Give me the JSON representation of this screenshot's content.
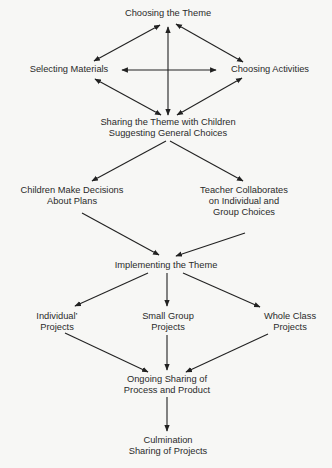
{
  "diagram": {
    "type": "flowchart",
    "nodes": {
      "choosing_theme": [
        "Choosing the Theme"
      ],
      "selecting_materials": [
        "Selecting Materials"
      ],
      "choosing_activities": [
        "Choosing Activities"
      ],
      "sharing_theme": [
        "Sharing the Theme with Children",
        "Suggesting General Choices"
      ],
      "children_decide": [
        "Children Make Decisions",
        "About Plans"
      ],
      "teacher_collaborates": [
        "Teacher Collaborates",
        "on Individual and",
        "Group Choices"
      ],
      "implementing": [
        "Implementing the Theme"
      ],
      "individual": [
        "Individual’",
        "Projects"
      ],
      "small_group": [
        "Small Group",
        "Projects"
      ],
      "whole_class": [
        "Whole Class",
        "Projects"
      ],
      "ongoing": [
        "Ongoing Sharing of",
        "Process and Product"
      ],
      "culmination": [
        "Culmination",
        "Sharing of Projects"
      ]
    },
    "edges": [
      {
        "from": "choosing_theme",
        "to": "selecting_materials",
        "bidirectional": true
      },
      {
        "from": "choosing_theme",
        "to": "choosing_activities",
        "bidirectional": true
      },
      {
        "from": "choosing_theme",
        "to": "sharing_theme",
        "bidirectional": true
      },
      {
        "from": "selecting_materials",
        "to": "choosing_activities",
        "bidirectional": true
      },
      {
        "from": "selecting_materials",
        "to": "sharing_theme",
        "bidirectional": true
      },
      {
        "from": "choosing_activities",
        "to": "sharing_theme",
        "bidirectional": true
      },
      {
        "from": "sharing_theme",
        "to": "children_decide"
      },
      {
        "from": "sharing_theme",
        "to": "teacher_collaborates"
      },
      {
        "from": "children_decide",
        "to": "implementing"
      },
      {
        "from": "teacher_collaborates",
        "to": "implementing"
      },
      {
        "from": "implementing",
        "to": "individual"
      },
      {
        "from": "implementing",
        "to": "small_group"
      },
      {
        "from": "implementing",
        "to": "whole_class"
      },
      {
        "from": "individual",
        "to": "ongoing"
      },
      {
        "from": "small_group",
        "to": "ongoing"
      },
      {
        "from": "whole_class",
        "to": "ongoing"
      },
      {
        "from": "ongoing",
        "to": "culmination"
      }
    ]
  }
}
